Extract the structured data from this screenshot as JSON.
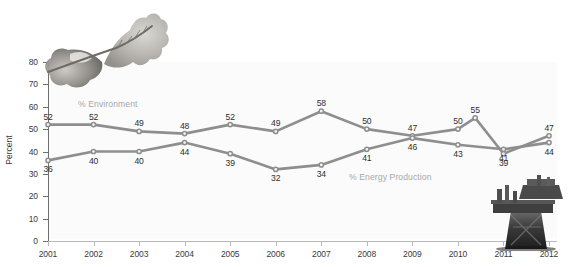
{
  "chart_data": {
    "type": "line",
    "title": "",
    "xlabel": "",
    "ylabel": "Percent",
    "ylim": [
      0,
      80
    ],
    "ytick_step": 10,
    "grid": false,
    "legend_position": "inline-annotation",
    "categories": [
      "2001",
      "2002",
      "2003",
      "2004",
      "2005",
      "2006",
      "2007",
      "2008",
      "2009",
      "2010",
      "2011",
      "2012"
    ],
    "series": [
      {
        "name": "% Environment",
        "color": "#8e8e8e",
        "values": [
          52,
          52,
          49,
          48,
          52,
          49,
          58,
          50,
          47,
          50,
          39,
          47
        ],
        "spike_2010_high": 55
      },
      {
        "name": "% Energy Production",
        "color": "#8e8e8e",
        "values": [
          36,
          40,
          40,
          44,
          39,
          32,
          34,
          41,
          46,
          43,
          41,
          44
        ]
      }
    ],
    "annotations": [
      {
        "name": "leaf-photo",
        "description": "oak leaf photograph",
        "position": "top-left"
      },
      {
        "name": "refinery-photo",
        "description": "industrial oil refinery photograph",
        "position": "bottom-right"
      }
    ]
  },
  "axis": {
    "y_tick_labels": [
      "0",
      "10",
      "20",
      "30",
      "40",
      "50",
      "60",
      "70",
      "80"
    ],
    "y_title": "Percent",
    "x_tick_labels": [
      "2001",
      "2002",
      "2003",
      "2004",
      "2005",
      "2006",
      "2007",
      "2008",
      "2009",
      "2010",
      "2011",
      "2012"
    ]
  },
  "legend": {
    "environment_label": "% Environment",
    "energy_label": "% Energy Production"
  },
  "point_labels": {
    "environment": [
      "52",
      "52",
      "49",
      "48",
      "52",
      "49",
      "58",
      "50",
      "47",
      "50",
      "55",
      "39",
      "47"
    ],
    "energy": [
      "36",
      "40",
      "40",
      "44",
      "39",
      "32",
      "34",
      "41",
      "46",
      "43",
      "41",
      "44"
    ]
  },
  "colors": {
    "line": "#8e8e8e",
    "axis": "#6f6f6f",
    "text": "#2e2e2e",
    "series_label": "#a8a8a8",
    "panel_background": "#fbfbfb"
  }
}
